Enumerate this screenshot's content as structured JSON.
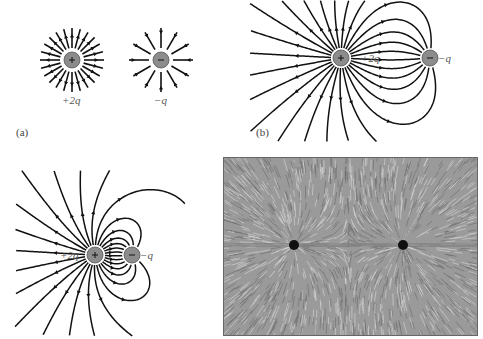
{
  "figure": {
    "panels": [
      {
        "id": "a",
        "label": "(a)",
        "description": "Isolated charges: field lines of +2q and -q drawn separately",
        "charges": [
          {
            "sign": "+",
            "label": "+2q",
            "x": 72,
            "y": 60,
            "lines": 24,
            "direction": "outward"
          },
          {
            "sign": "-",
            "label": "-q",
            "x": 161,
            "y": 60,
            "lines": 12,
            "direction": "inward"
          }
        ]
      },
      {
        "id": "b",
        "label": "(b)",
        "description": "Field lines of +2q and -q separated by a larger distance",
        "charges": [
          {
            "sign": "+",
            "label": "+2q",
            "x": 341,
            "y": 58
          },
          {
            "sign": "-",
            "label": "-q",
            "x": 430,
            "y": 58
          }
        ]
      },
      {
        "id": "c",
        "label": "",
        "description": "Field lines of +2q and -q close together",
        "charges": [
          {
            "sign": "+",
            "label": "+2q",
            "x": 95,
            "y": 255
          },
          {
            "sign": "-",
            "label": "-q",
            "x": 132,
            "y": 255
          }
        ]
      },
      {
        "id": "d",
        "label": "",
        "description": "Photograph of field-line pattern (grass seeds) around two charged spheres"
      }
    ],
    "labels": {
      "a_pos": "+2q",
      "a_neg": "−q",
      "a_panel": "(a)",
      "b_pos": "+2q",
      "b_neg": "−q",
      "b_panel": "(b)",
      "c_pos": "+2q",
      "c_neg": "−q"
    },
    "colors": {
      "line": "#111111",
      "charge_fill": "#8c8c8c",
      "photo_bg": "#9a9a9a"
    }
  }
}
